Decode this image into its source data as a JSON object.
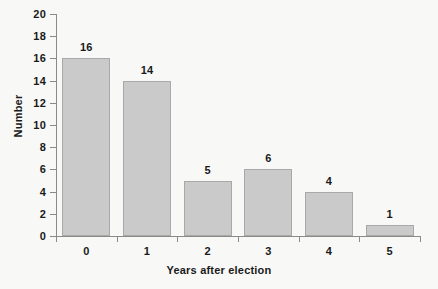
{
  "chart_data": {
    "type": "bar",
    "title": "",
    "subtitle": "",
    "xlabel": "Years after election",
    "ylabel": "Number",
    "categories": [
      "0",
      "1",
      "2",
      "3",
      "4",
      "5"
    ],
    "values": [
      16,
      14,
      5,
      6,
      4,
      1
    ],
    "data_labels": [
      "16",
      "14",
      "5",
      "6",
      "4",
      "1"
    ],
    "ylim": [
      0,
      20
    ],
    "y_ticks": [
      0,
      2,
      4,
      6,
      8,
      10,
      12,
      14,
      16,
      18,
      20
    ],
    "y_tick_labels": [
      "0",
      "2",
      "4",
      "6",
      "8",
      "10",
      "12",
      "14",
      "16",
      "18",
      "20"
    ],
    "grid": false,
    "legend": null,
    "legend_position": "none",
    "bar_fill_color": "#cacaca",
    "bar_border_color": "#a9a9a9",
    "axis_color": "#8a8a8a",
    "text_color": "#1a1a1a",
    "background_color": "#f8f8f6"
  }
}
